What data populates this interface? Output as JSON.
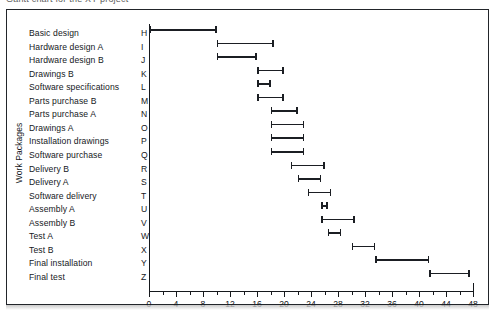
{
  "caption": {
    "text": "Gantt chart for the XY project"
  },
  "axis": {
    "y_title": "Work Packages",
    "x_ticks_major": [
      0,
      4,
      8,
      12,
      16,
      20,
      24,
      28,
      32,
      36,
      40,
      44,
      48
    ],
    "x_ticks_minor": [
      2,
      6,
      10,
      14,
      18,
      22,
      26,
      30,
      34,
      38,
      42,
      46
    ],
    "x_min": 0,
    "x_max": 48
  },
  "colors": {
    "ink": "#15181c",
    "bar": "#1b1e23",
    "frame": "#22252a",
    "paper": "#ffffff"
  },
  "chart_data": {
    "type": "bar",
    "title": "Gantt chart for the XY project",
    "xlabel": "",
    "ylabel": "Work Packages",
    "xlim": [
      0,
      48
    ],
    "grid": false,
    "orientation": "horizontal-ranges",
    "categories": [
      "Basic design",
      "Hardware design A",
      "Hardware design B",
      "Drawings B",
      "Software specifications",
      "Parts purchase B",
      "Parts purchase A",
      "Drawings A",
      "Installation drawings",
      "Software purchase",
      "Delivery B",
      "Delivery A",
      "Software delivery",
      "Assembly A",
      "Assembly B",
      "Test A",
      "Test B",
      "Final installation",
      "Final test"
    ],
    "codes": [
      "H",
      "I",
      "J",
      "K",
      "L",
      "M",
      "N",
      "O",
      "P",
      "Q",
      "R",
      "S",
      "T",
      "U",
      "V",
      "W",
      "X",
      "Y",
      "Z"
    ],
    "tasks": [
      {
        "code": "H",
        "label": "Basic design",
        "start": 0,
        "end": 10
      },
      {
        "code": "I",
        "label": "Hardware design A",
        "start": 10,
        "end": 18.5
      },
      {
        "code": "J",
        "label": "Hardware design B",
        "start": 10,
        "end": 16
      },
      {
        "code": "K",
        "label": "Drawings B",
        "start": 16,
        "end": 20
      },
      {
        "code": "L",
        "label": "Software specifications",
        "start": 16,
        "end": 18
      },
      {
        "code": "M",
        "label": "Parts purchase B",
        "start": 16,
        "end": 20
      },
      {
        "code": "N",
        "label": "Parts purchase A",
        "start": 18,
        "end": 22
      },
      {
        "code": "O",
        "label": "Drawings A",
        "start": 18,
        "end": 23
      },
      {
        "code": "P",
        "label": "Installation drawings",
        "start": 18,
        "end": 23
      },
      {
        "code": "Q",
        "label": "Software purchase",
        "start": 18,
        "end": 23
      },
      {
        "code": "R",
        "label": "Delivery B",
        "start": 21,
        "end": 26
      },
      {
        "code": "S",
        "label": "Delivery A",
        "start": 22,
        "end": 25.5
      },
      {
        "code": "T",
        "label": "Software delivery",
        "start": 23.5,
        "end": 27
      },
      {
        "code": "U",
        "label": "Assembly A",
        "start": 25.5,
        "end": 26.5
      },
      {
        "code": "V",
        "label": "Assembly B",
        "start": 25.5,
        "end": 30.5
      },
      {
        "code": "W",
        "label": "Test A",
        "start": 26.5,
        "end": 28.5
      },
      {
        "code": "X",
        "label": "Test B",
        "start": 30,
        "end": 33.5
      },
      {
        "code": "Y",
        "label": "Final installation",
        "start": 33.5,
        "end": 41.5
      },
      {
        "code": "Z",
        "label": "Final test",
        "start": 41.5,
        "end": 47.5
      }
    ]
  }
}
